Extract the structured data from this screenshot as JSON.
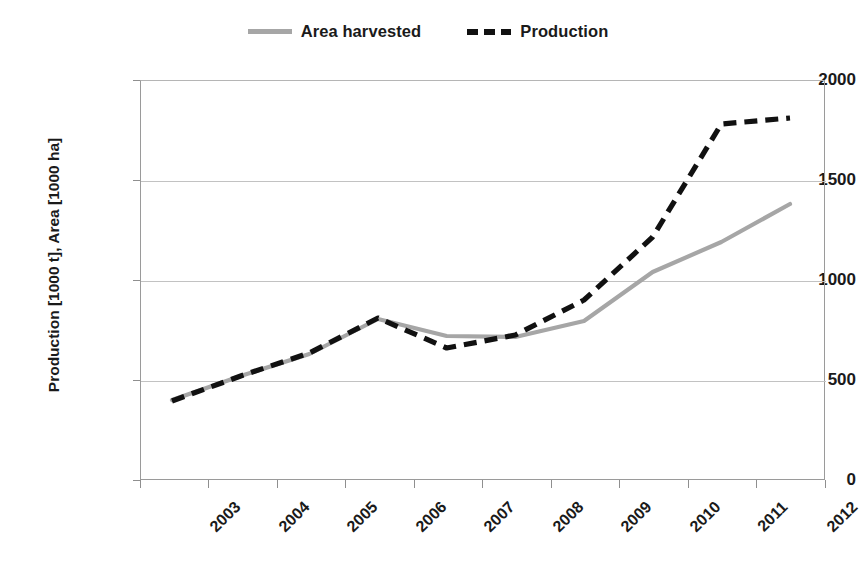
{
  "chart_data": {
    "type": "line",
    "title": "",
    "xlabel": "",
    "ylabel": "Production [1000 t], Area [1000 ha]",
    "categories": [
      "2003",
      "2004",
      "2005",
      "2006",
      "2007",
      "2008",
      "2009",
      "2010",
      "2011",
      "2012"
    ],
    "x_tick_labels": [
      "2003",
      "2004",
      "2005",
      "2006",
      "2007",
      "2008",
      "2009",
      "2010",
      "2011",
      "2012"
    ],
    "y_tick_labels": [
      "0",
      "500",
      "1000",
      "1500",
      "2000"
    ],
    "y_ticks": [
      0,
      500,
      1000,
      1500,
      2000
    ],
    "ylim": [
      0,
      2000
    ],
    "grid": "horizontal",
    "legend_position": "top-center",
    "series": [
      {
        "name": "Area harvested",
        "style": "solid",
        "color": "#a6a6a6",
        "values": [
          400,
          520,
          630,
          805,
          720,
          715,
          795,
          1040,
          1190,
          1380
        ]
      },
      {
        "name": "Production",
        "style": "dashed",
        "color": "#111111",
        "values": [
          395,
          520,
          635,
          810,
          660,
          725,
          900,
          1215,
          1780,
          1810
        ]
      }
    ]
  },
  "legend": {
    "entries": [
      {
        "label": "Area harvested",
        "swatch": "solid-gray-line-icon"
      },
      {
        "label": "Production",
        "swatch": "dashed-black-line-icon"
      }
    ]
  },
  "axes": {
    "y_title": "Production [1000 t], Area [1000 ha]",
    "y_labels": [
      "2000",
      "1500",
      "1000",
      "500",
      "0"
    ],
    "x_labels": [
      "2003",
      "2004",
      "2005",
      "2006",
      "2007",
      "2008",
      "2009",
      "2010",
      "2011",
      "2012"
    ]
  },
  "colors": {
    "area_harvested": "#a6a6a6",
    "production": "#111111",
    "gridline": "#c2c2c2",
    "axis": "#9a9a9a",
    "text": "#1a1a1a",
    "background": "#ffffff"
  }
}
